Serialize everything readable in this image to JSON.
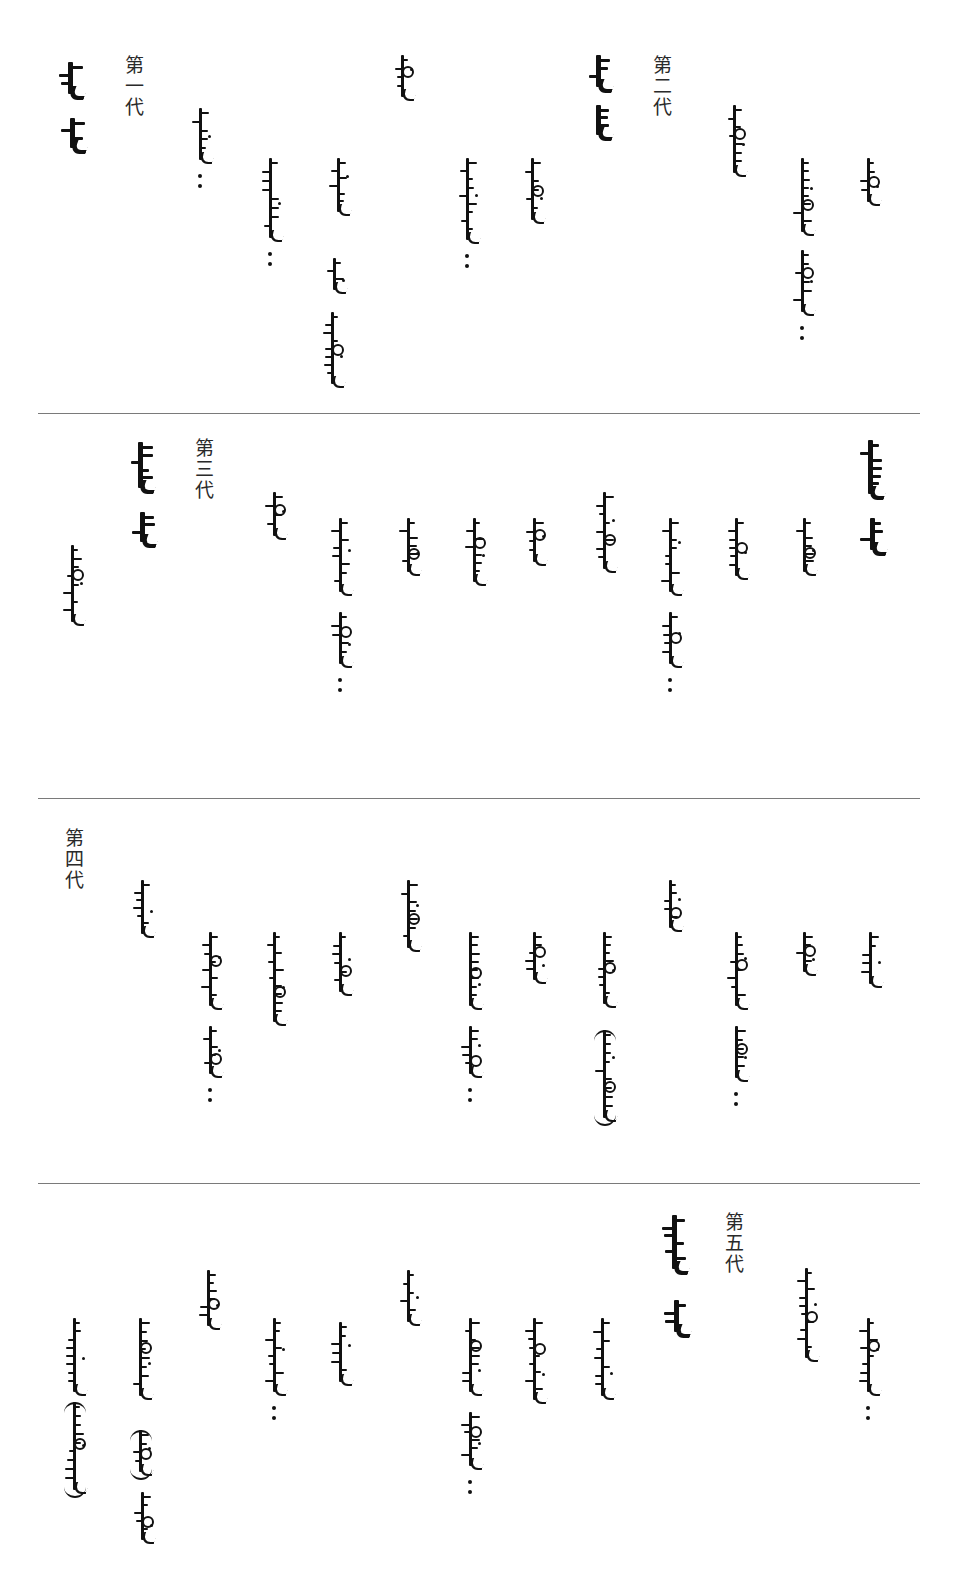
{
  "document": {
    "type": "genealogy-table",
    "script": "traditional Mongolian (vertical)",
    "dividers_y": [
      413,
      798,
      1183
    ]
  },
  "sections": [
    {
      "label": "第一代",
      "label_pos": [
        122,
        55
      ],
      "words": [
        {
          "text": "ᠡᠴᠢᠭᠡ",
          "x": 58,
          "y": 62,
          "h": 42,
          "bold": true,
          "role": "heading-word"
        },
        {
          "text": "ᠶᠢᠨ",
          "x": 60,
          "y": 118,
          "h": 40,
          "bold": true,
          "role": "heading-word"
        },
        {
          "text": "ᠪᠠᠶᠠᠷ",
          "x": 188,
          "y": 108,
          "h": 60,
          "bold": false,
          "colon": true
        },
        {
          "text": "ᠬᠥᠪᠡᠭᠦᠨ",
          "x": 258,
          "y": 158,
          "h": 88,
          "bold": false,
          "colon": true
        },
        {
          "text": "ᠲᠠᠢᠵᠤ",
          "x": 326,
          "y": 158,
          "h": 62,
          "bold": false
        },
        {
          "text": "ᠲᠥᠷᠦ",
          "x": 322,
          "y": 258,
          "h": 40,
          "bold": false
        },
        {
          "text": "ᠪᠣᠯ",
          "x": 320,
          "y": 312,
          "h": 80,
          "bold": false
        },
        {
          "text": "ᠲᠥᠷᠦ ᠪᠣ",
          "x": 390,
          "y": 55,
          "h": 50,
          "bold": false
        },
        {
          "text": "ᠬᠥᠪᠡᠭᠦᠨ",
          "x": 455,
          "y": 158,
          "h": 90,
          "bold": false,
          "colon": true
        },
        {
          "text": "ᠲᠠᠢᠵᠤ",
          "x": 520,
          "y": 158,
          "h": 70,
          "bold": false
        },
        {
          "text": "ᠡᠬᠢ",
          "x": 586,
          "y": 55,
          "h": 42,
          "bold": true,
          "role": "heading-word"
        },
        {
          "text": "ᠶᠢᠨ",
          "x": 586,
          "y": 105,
          "h": 40,
          "bold": true,
          "role": "heading-word"
        }
      ]
    },
    {
      "label": "第二代",
      "label_pos": [
        650,
        55
      ],
      "words": [
        {
          "text": "ᠲᠠᠢᠵᠤ",
          "x": 722,
          "y": 105,
          "h": 76,
          "bold": false
        },
        {
          "text": "ᠬᠥᠪᠡᠭᠦᠨ",
          "x": 790,
          "y": 158,
          "h": 82,
          "bold": false
        },
        {
          "text": "ᠲᠠᠢᠵᠢ",
          "x": 790,
          "y": 250,
          "h": 70,
          "bold": false,
          "colon": true
        },
        {
          "text": "ᠲᠠᠢᠵᠤ",
          "x": 856,
          "y": 158,
          "h": 52,
          "bold": false
        }
      ]
    },
    {
      "label": "第三代",
      "label_pos": [
        192,
        438
      ],
      "words": [
        {
          "text": "ᠡᠴᠢᠭᠡ",
          "x": 60,
          "y": 545,
          "h": 85,
          "bold": false
        },
        {
          "text": "ᠡᠬᠢᠭᠡ",
          "x": 128,
          "y": 442,
          "h": 56,
          "bold": true,
          "role": "heading-word"
        },
        {
          "text": "ᠶᠢᠨ",
          "x": 130,
          "y": 512,
          "h": 40,
          "bold": true,
          "role": "heading-word"
        },
        {
          "text": "ᠲᠠᠢᠵᠤ",
          "x": 262,
          "y": 492,
          "h": 52,
          "bold": false
        },
        {
          "text": "ᠬᠥᠪᠡᠭᠦᠨ",
          "x": 328,
          "y": 518,
          "h": 82,
          "bold": false
        },
        {
          "text": "ᠲᠠᠢᠵᠢ",
          "x": 328,
          "y": 612,
          "h": 60,
          "bold": false,
          "colon": true
        },
        {
          "text": "ᠨᠠᠢᠯ",
          "x": 396,
          "y": 518,
          "h": 62,
          "bold": false
        },
        {
          "text": "ᠪᠠᠢᠳᠤ",
          "x": 462,
          "y": 518,
          "h": 72,
          "bold": false
        },
        {
          "text": "ᠪᠣᠯ",
          "x": 522,
          "y": 518,
          "h": 52,
          "bold": false
        },
        {
          "text": "ᠡᠴᠢᠭᠡ",
          "x": 592,
          "y": 492,
          "h": 85,
          "bold": false
        },
        {
          "text": "ᠬᠥᠪᠡᠭᠦᠨ",
          "x": 658,
          "y": 518,
          "h": 82,
          "bold": false
        },
        {
          "text": "ᠲᠠᠢᠵᠢ",
          "x": 658,
          "y": 612,
          "h": 60,
          "bold": false,
          "colon": true
        },
        {
          "text": "ᠲᠠᠢᠯ",
          "x": 724,
          "y": 518,
          "h": 66,
          "bold": false
        },
        {
          "text": "ᠪᠠᠶᠠᠳ",
          "x": 792,
          "y": 518,
          "h": 62,
          "bold": false
        },
        {
          "text": "ᠡᠬᠢᠭᠡ",
          "x": 858,
          "y": 440,
          "h": 64,
          "bold": true,
          "role": "heading-word"
        },
        {
          "text": "ᠶᠢᠨ",
          "x": 860,
          "y": 518,
          "h": 42,
          "bold": true,
          "role": "heading-word"
        }
      ]
    },
    {
      "label": "第四代",
      "label_pos": [
        62,
        828
      ],
      "words": [
        {
          "text": "ᠨᠠᠢᠯ",
          "x": 130,
          "y": 880,
          "h": 62,
          "bold": false
        },
        {
          "text": "ᠬᠥᠪᠡᠭᠦᠨ",
          "x": 198,
          "y": 932,
          "h": 82,
          "bold": false
        },
        {
          "text": "ᠲᠠᠢᠵᠢ",
          "x": 198,
          "y": 1026,
          "h": 56,
          "bold": false,
          "colon": true
        },
        {
          "text": "ᠰᠠᠢᠨᠴᠤᠭ",
          "x": 262,
          "y": 932,
          "h": 98,
          "bold": false
        },
        {
          "text": "ᠮᠠᠩᠭᠠ",
          "x": 328,
          "y": 932,
          "h": 68,
          "bold": false
        },
        {
          "text": "ᠪᠠᠢᠳᠤ",
          "x": 396,
          "y": 880,
          "h": 76,
          "bold": false
        },
        {
          "text": "ᠬᠥᠪᠡᠭᠦᠨ",
          "x": 458,
          "y": 932,
          "h": 82,
          "bold": false
        },
        {
          "text": "ᠲᠠᠢᠵᠢ",
          "x": 458,
          "y": 1026,
          "h": 56,
          "bold": false,
          "colon": true
        },
        {
          "text": "ᠪᠢᠯ",
          "x": 522,
          "y": 932,
          "h": 56,
          "bold": false
        },
        {
          "text": "ᠪᠠᠶᠠᠷ",
          "x": 592,
          "y": 932,
          "h": 80,
          "bold": false
        },
        {
          "text": "(ᠪᠠᠶᠠᠷᠮᠠ)",
          "x": 592,
          "y": 1030,
          "h": 96,
          "bold": false,
          "paren": true
        },
        {
          "text": "ᠪᠣᠯ",
          "x": 658,
          "y": 880,
          "h": 56,
          "bold": false
        },
        {
          "text": "ᠬᠥᠪᠡᠭᠦᠨ",
          "x": 724,
          "y": 932,
          "h": 82,
          "bold": false
        },
        {
          "text": "ᠲᠠᠢᠯ",
          "x": 724,
          "y": 1026,
          "h": 60,
          "bold": false,
          "colon": true
        },
        {
          "text": "ᠶᠢᠯ",
          "x": 792,
          "y": 932,
          "h": 48,
          "bold": false
        },
        {
          "text": "ᠮᠠᠩᠭᠠ",
          "x": 858,
          "y": 932,
          "h": 60,
          "bold": false
        }
      ]
    },
    {
      "label": "第五代",
      "label_pos": [
        722,
        1212
      ],
      "words": [
        {
          "text": "ᠮᠠᠨᠵᠤᠷ",
          "x": 62,
          "y": 1318,
          "h": 82,
          "bold": false
        },
        {
          "text": "(ᠪᠠᠶᠠᠷᠮᠠ)",
          "x": 62,
          "y": 1402,
          "h": 96,
          "bold": false,
          "paren": true
        },
        {
          "text": "ᠮᠠᠨᠵᠤᠷ",
          "x": 128,
          "y": 1318,
          "h": 86,
          "bold": false
        },
        {
          "text": "(ᠮᠠᠯ)",
          "x": 128,
          "y": 1430,
          "h": 50,
          "bold": false,
          "paren": true
        },
        {
          "text": "ᠵᠠᠮᠰᠤ",
          "x": 130,
          "y": 1492,
          "h": 56,
          "bold": false
        },
        {
          "text": "ᠲᠠᠢᠯ",
          "x": 196,
          "y": 1270,
          "h": 64,
          "bold": false
        },
        {
          "text": "ᠬᠥᠪᠡᠭᠦᠨ",
          "x": 262,
          "y": 1318,
          "h": 82,
          "bold": false,
          "colon": true
        },
        {
          "text": "ᠨᠠᠢᠯ",
          "x": 328,
          "y": 1322,
          "h": 68,
          "bold": false
        },
        {
          "text": "ᠪᠠᠶᠠᠳ",
          "x": 396,
          "y": 1270,
          "h": 60,
          "bold": false
        },
        {
          "text": "ᠬᠥᠪᠡᠭᠦᠨ",
          "x": 458,
          "y": 1318,
          "h": 82,
          "bold": false
        },
        {
          "text": "ᠲᠠᠢᠵᠢ",
          "x": 458,
          "y": 1412,
          "h": 62,
          "bold": false,
          "colon": true
        },
        {
          "text": "ᠬᠥᠮᠤᠷᠵᠢ",
          "x": 522,
          "y": 1318,
          "h": 90,
          "bold": false
        },
        {
          "text": "ᠬᠥᠮᠤᠷᠮᠠ",
          "x": 590,
          "y": 1318,
          "h": 86,
          "bold": false
        },
        {
          "text": "ᠡᠬᠢᠭᠡ",
          "x": 662,
          "y": 1215,
          "h": 64,
          "bold": true,
          "role": "heading-word"
        },
        {
          "text": "ᠶᠢᠨ",
          "x": 664,
          "y": 1300,
          "h": 42,
          "bold": true,
          "role": "heading-word"
        },
        {
          "text": "ᠰᠠᠢᠨᠴᠤᠭ",
          "x": 794,
          "y": 1268,
          "h": 98,
          "bold": false
        },
        {
          "text": "ᠬᠥᠪᠡᠭᠦᠨ",
          "x": 856,
          "y": 1318,
          "h": 82,
          "bold": false,
          "colon": true
        }
      ]
    }
  ]
}
